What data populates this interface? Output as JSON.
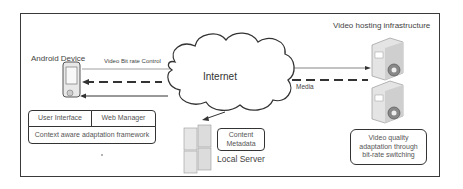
{
  "diagram": {
    "frame": true,
    "nodes": {
      "android": {
        "label": "Android Device"
      },
      "internet": {
        "label": "Internet"
      },
      "hosting": {
        "label": "Video hosting infrastructure"
      },
      "local": {
        "label": "Local Server"
      }
    },
    "boxes": {
      "user_interface": "User Interface",
      "web_manager": "Web Manager",
      "framework": "Context aware adaptation framework",
      "content_metadata": "Content Metadata",
      "video_quality": "Video quality adaptation through bit-rate switching"
    },
    "edges": {
      "bitrate_control": "Video Bit rate Control",
      "media": "Media"
    },
    "colors": {
      "line": "#333333",
      "text": "#444444",
      "server": "#d9d9d9"
    }
  }
}
